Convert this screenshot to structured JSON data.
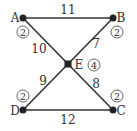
{
  "graph": {
    "nodes": [
      {
        "id": "A",
        "x": 23,
        "y": 18,
        "label_x": 15,
        "label_y": 22,
        "weight": "2",
        "weight_x": 23,
        "weight_y": 32
      },
      {
        "id": "B",
        "x": 113,
        "y": 18,
        "label_x": 121,
        "label_y": 22,
        "weight": "2",
        "weight_x": 117,
        "weight_y": 32
      },
      {
        "id": "E",
        "x": 68,
        "y": 64,
        "label_x": 79,
        "label_y": 69,
        "weight": "4",
        "weight_x": 94,
        "weight_y": 65
      },
      {
        "id": "D",
        "x": 23,
        "y": 110,
        "label_x": 15,
        "label_y": 115,
        "weight": "2",
        "weight_x": 23,
        "weight_y": 96
      },
      {
        "id": "C",
        "x": 113,
        "y": 110,
        "label_x": 121,
        "label_y": 115,
        "weight": "2",
        "weight_x": 117,
        "weight_y": 96
      }
    ],
    "edges": [
      {
        "from": "A",
        "to": "B",
        "weight": "11",
        "lx": 68,
        "ly": 14
      },
      {
        "from": "A",
        "to": "E",
        "weight": "10",
        "lx": 39,
        "ly": 53
      },
      {
        "from": "E",
        "to": "B",
        "weight": "7",
        "lx": 96,
        "ly": 48
      },
      {
        "from": "D",
        "to": "E",
        "weight": "9",
        "lx": 43,
        "ly": 85
      },
      {
        "from": "E",
        "to": "C",
        "weight": "8",
        "lx": 96,
        "ly": 88
      },
      {
        "from": "D",
        "to": "C",
        "weight": "12",
        "lx": 68,
        "ly": 124
      }
    ]
  },
  "colors": {
    "edge": "#333333",
    "node": "#222222",
    "circle": "#555555"
  }
}
